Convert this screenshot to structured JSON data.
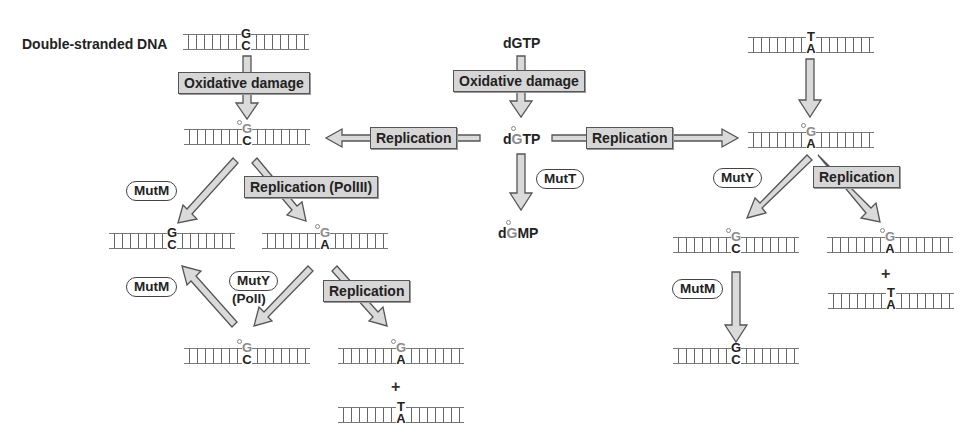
{
  "title_label": "Double-stranded DNA",
  "colors": {
    "arrow_fill": "#d9d9d9",
    "arrow_stroke": "#555555",
    "box_fill": "#d6d6d6",
    "oxidized_base": "#8a8a8a",
    "text": "#222222"
  },
  "nucleotides": {
    "dgtp": "dGTP",
    "oxo_dgtp": {
      "prefix": "d",
      "base": "G",
      "suffix": "TP"
    },
    "oxo_dgmp": {
      "prefix": "d",
      "base": "G",
      "suffix": "MP"
    }
  },
  "process_boxes": {
    "oxidative_damage_left": "Oxidative damage",
    "oxidative_damage_center": "Oxidative damage",
    "replication_to_left": "Replication",
    "replication_to_right": "Replication",
    "replication_pol3": "Replication (PolIII)",
    "replication_left_bottom": "Replication",
    "replication_right": "Replication"
  },
  "enzymes": {
    "mutm_left_top": "MutM",
    "mutm_left_bottom": "MutM",
    "muty_left": "MutY",
    "muty_left_sub": "(PolI)",
    "mutt": "MutT",
    "muty_right": "MutY",
    "mutm_right": "MutM"
  },
  "dna_pairs": [
    {
      "id": "start_gc",
      "top": "G",
      "bottom": "C",
      "oxidized": false
    },
    {
      "id": "oxog_c_left",
      "top": "G",
      "bottom": "C",
      "oxidized": true
    },
    {
      "id": "repaired_gc_left",
      "top": "G",
      "bottom": "C",
      "oxidized": false
    },
    {
      "id": "oxog_a_left",
      "top": "G",
      "bottom": "A",
      "oxidized": true
    },
    {
      "id": "oxog_c_left_bottom",
      "top": "G",
      "bottom": "C",
      "oxidized": true
    },
    {
      "id": "oxog_a_left_bottom",
      "top": "G",
      "bottom": "A",
      "oxidized": true
    },
    {
      "id": "ta_left_bottom",
      "top": "T",
      "bottom": "A",
      "oxidized": false
    },
    {
      "id": "start_ta_right",
      "top": "T",
      "bottom": "A",
      "oxidized": false
    },
    {
      "id": "oxog_a_right",
      "top": "G",
      "bottom": "A",
      "oxidized": true
    },
    {
      "id": "oxog_c_right",
      "top": "G",
      "bottom": "C",
      "oxidized": true
    },
    {
      "id": "oxog_a_right_bottom",
      "top": "G",
      "bottom": "A",
      "oxidized": true
    },
    {
      "id": "ta_right_bottom",
      "top": "T",
      "bottom": "A",
      "oxidized": false
    },
    {
      "id": "repaired_gc_right",
      "top": "G",
      "bottom": "C",
      "oxidized": false
    }
  ],
  "plus_signs": [
    "+",
    "+"
  ]
}
